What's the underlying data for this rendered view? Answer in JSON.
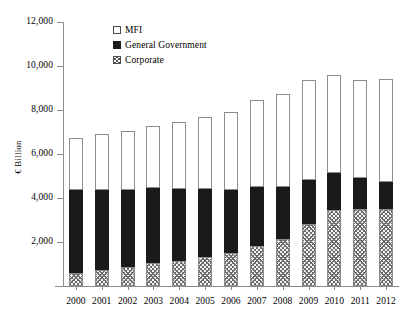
{
  "chart_data": {
    "type": "bar",
    "stacked": true,
    "title": "",
    "xlabel": "",
    "ylabel": "€ Billion",
    "ylim": [
      0,
      12000
    ],
    "ytick_values": [
      0,
      2000,
      4000,
      6000,
      8000,
      10000,
      12000
    ],
    "ytick_labels": [
      "",
      "2,000",
      "4,000",
      "6,000",
      "8,000",
      "10,000",
      "12,000"
    ],
    "grid": false,
    "legend_position": "top-left-inside",
    "categories": [
      "2000",
      "2001",
      "2002",
      "2003",
      "2004",
      "2005",
      "2006",
      "2007",
      "2008",
      "2009",
      "2010",
      "2011",
      "2012"
    ],
    "series": [
      {
        "name": "Corporate",
        "marker": "hatched-square",
        "values": [
          600,
          750,
          880,
          1050,
          1150,
          1300,
          1500,
          1800,
          2150,
          2800,
          3450,
          3500,
          3480
        ]
      },
      {
        "name": "General Government",
        "marker": "filled-square",
        "values": [
          3750,
          3600,
          3500,
          3400,
          3250,
          3100,
          2850,
          2700,
          2350,
          2000,
          1700,
          1430,
          1270
        ]
      },
      {
        "name": "MFI",
        "marker": "empty-square",
        "values": [
          2400,
          2550,
          2680,
          2820,
          3050,
          3300,
          3570,
          3950,
          4250,
          4550,
          4450,
          4450,
          4640
        ]
      }
    ],
    "totals": [
      6750,
      6900,
      7060,
      7270,
      7450,
      7700,
      7920,
      8450,
      8750,
      9350,
      9600,
      9380,
      9390
    ]
  },
  "legend": {
    "items": [
      {
        "label": "MFI",
        "key": "empty-square"
      },
      {
        "label": "General Government",
        "key": "filled-square"
      },
      {
        "label": "Corporate",
        "key": "hatched-square"
      }
    ]
  },
  "axes": {
    "y_title": "€ Billion"
  },
  "colors": {
    "mfi": "#ffffff",
    "general_government": "#1a1a1a",
    "corporate_hatch": "#6e6e6e",
    "axis": "#8c8c8c",
    "text": "#000000"
  }
}
